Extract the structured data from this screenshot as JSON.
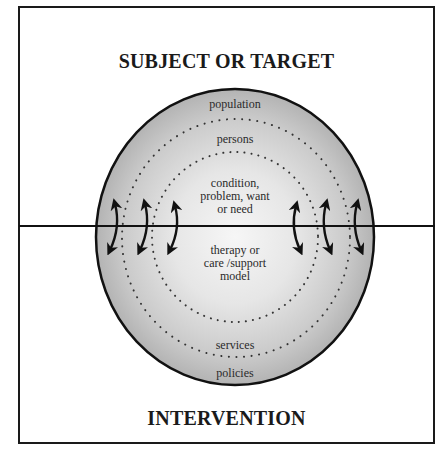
{
  "diagram": {
    "top_heading": "SUBJECT OR TARGET",
    "bottom_heading": "INTERVENTION",
    "rings": {
      "outer": {
        "top_label": "population",
        "bottom_label": "policies"
      },
      "middle": {
        "top_label": "persons",
        "bottom_label": "services"
      },
      "inner": {
        "top_label_lines": [
          "condition,",
          "problem, want",
          "or need"
        ],
        "bottom_label_lines": [
          "therapy or",
          "care /support",
          "model"
        ]
      }
    },
    "divider": "horizontal line separating subject/target (above) from intervention (below)",
    "arrows": {
      "count": 6,
      "type": "curved double-headed arrows crossing the divider",
      "left_side": 3,
      "right_side": 3
    },
    "colors": {
      "frame": "#1a1a1a",
      "circle_fill_outer": "#b8b8b8",
      "circle_fill_center": "#f4f4f4",
      "dots": "#333333",
      "text": "#1a1a1a"
    }
  }
}
